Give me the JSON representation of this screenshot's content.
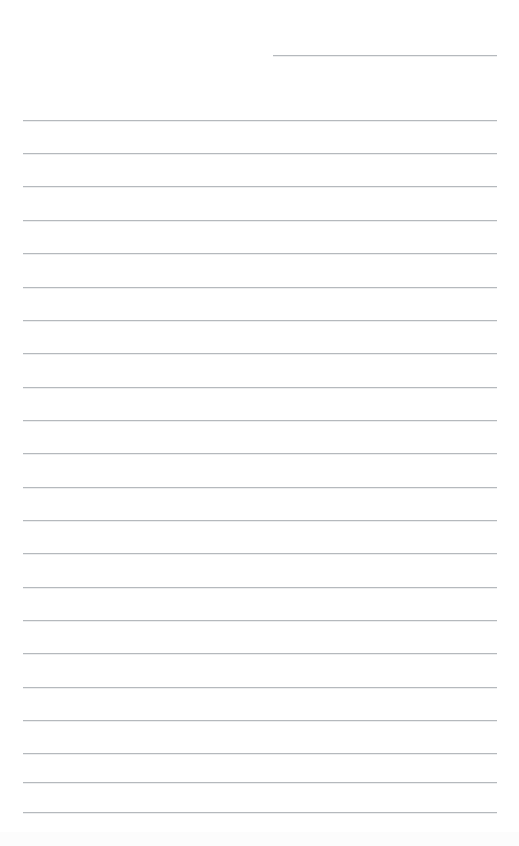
{
  "page": {
    "kind": "ruled-notepaper",
    "width": 519,
    "height": 846,
    "background_color": "#ffffff",
    "rule_color": "#b5b9bd",
    "rule_thickness_px": 1,
    "rule_spacing_px": 33.3,
    "content_text": "",
    "is_blank": true
  },
  "header_rule": {
    "name": "header-rule",
    "x": 273,
    "y": 55,
    "width": 224,
    "text": ""
  },
  "body_rules": [
    {
      "y": 120,
      "x": 23,
      "width": 474,
      "text": ""
    },
    {
      "y": 153,
      "x": 23,
      "width": 474,
      "text": ""
    },
    {
      "y": 186,
      "x": 23,
      "width": 474,
      "text": ""
    },
    {
      "y": 220,
      "x": 23,
      "width": 474,
      "text": ""
    },
    {
      "y": 253,
      "x": 23,
      "width": 474,
      "text": ""
    },
    {
      "y": 287,
      "x": 23,
      "width": 474,
      "text": ""
    },
    {
      "y": 320,
      "x": 23,
      "width": 474,
      "text": ""
    },
    {
      "y": 353,
      "x": 23,
      "width": 474,
      "text": ""
    },
    {
      "y": 387,
      "x": 23,
      "width": 474,
      "text": ""
    },
    {
      "y": 420,
      "x": 23,
      "width": 474,
      "text": ""
    },
    {
      "y": 453,
      "x": 23,
      "width": 474,
      "text": ""
    },
    {
      "y": 487,
      "x": 23,
      "width": 474,
      "text": ""
    },
    {
      "y": 520,
      "x": 23,
      "width": 474,
      "text": ""
    },
    {
      "y": 553,
      "x": 23,
      "width": 474,
      "text": ""
    },
    {
      "y": 587,
      "x": 23,
      "width": 474,
      "text": ""
    },
    {
      "y": 620,
      "x": 23,
      "width": 474,
      "text": ""
    },
    {
      "y": 653,
      "x": 23,
      "width": 474,
      "text": ""
    },
    {
      "y": 687,
      "x": 23,
      "width": 474,
      "text": ""
    },
    {
      "y": 720,
      "x": 23,
      "width": 474,
      "text": ""
    },
    {
      "y": 753,
      "x": 23,
      "width": 474,
      "text": ""
    },
    {
      "y": 782,
      "x": 23,
      "width": 474,
      "text": ""
    },
    {
      "y": 812,
      "x": 23,
      "width": 474,
      "text": ""
    }
  ],
  "bottom_artifact": {
    "y": 832,
    "height": 14,
    "color": "#fcfcfc"
  }
}
